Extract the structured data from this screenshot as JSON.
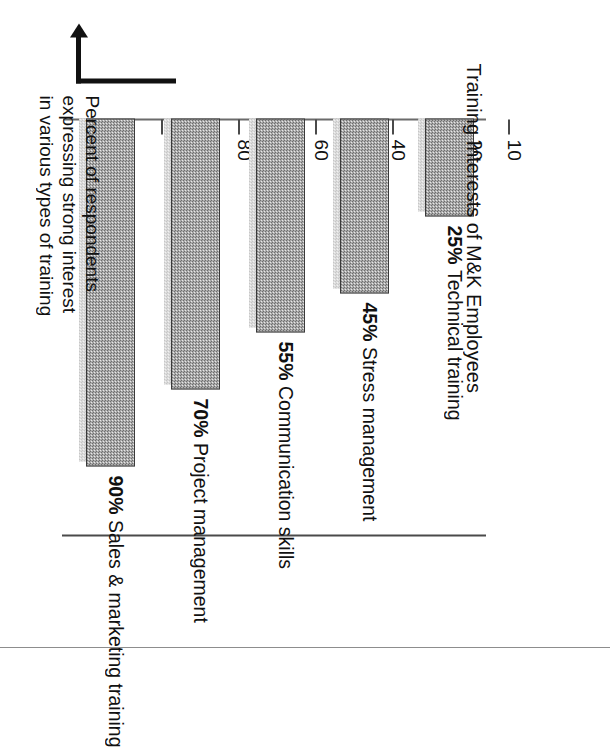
{
  "chart_data": {
    "type": "bar",
    "orientation": "horizontal",
    "title": "Training Interests of M&K Employees",
    "xlabel": "Percent of respondents expressing strong interest in various types of training",
    "ylabel": "",
    "axis_caption_lines": [
      "Percent of respondents",
      "expressing strong interest",
      "in various types of training"
    ],
    "categories": [
      "Sales & marketing training",
      "Project management",
      "Communication skills",
      "Stress management",
      "Technical training"
    ],
    "values": [
      90,
      70,
      55,
      45,
      25
    ],
    "value_labels": [
      "90%",
      "70%",
      "55%",
      "45%",
      "25%"
    ],
    "bar_labels": [
      "90% Sales & marketing training",
      "70% Project management",
      "55% Communication skills",
      "45% Stress management",
      "25% Technical training"
    ],
    "tick_labels": [
      "100",
      "90",
      "80",
      "70",
      "60",
      "50",
      "40",
      "30",
      "20",
      "10"
    ],
    "ticks": [
      100,
      90,
      80,
      70,
      60,
      50,
      40,
      30,
      20,
      10
    ],
    "axis_range": [
      0,
      100
    ],
    "axis_direction": "descending",
    "grid": false,
    "legend": "none",
    "colors": {
      "bar_fill": "#a8a8a8",
      "bar_border": "#3a3a3a",
      "bar_shadow": "#d8d8d8",
      "axis": "#4a4a4a",
      "text": "#111111",
      "background": "#ffffff"
    }
  }
}
